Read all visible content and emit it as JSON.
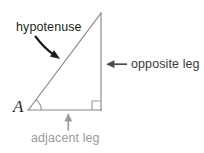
{
  "figure": {
    "kind": "right-triangle-geometry-diagram",
    "width": 204,
    "height": 153,
    "background_color": "#ffffff",
    "labels": {
      "hypotenuse": "hypotenuse",
      "opposite_leg": "opposite leg",
      "adjacent_leg": "adjacent leg",
      "vertex_a": "A"
    },
    "colors": {
      "triangle_stroke": "#8a8a8a",
      "hypotenuse_stroke": "#8a8a8a",
      "right_angle_marker": "#9a9a9a",
      "angle_arc": "#8a8a8a",
      "hypotenuse_text": "#231f20",
      "hypotenuse_arrow": "#1a1a1a",
      "opposite_text": "#3a3a3a",
      "opposite_arrow": "#4a4a4a",
      "adjacent_text": "#9a9a9a",
      "adjacent_arrow": "#9a9a9a",
      "vertex_text": "#2b2b2b"
    },
    "geometry": {
      "vertex_a": [
        28,
        110
      ],
      "vertex_right_angle": [
        101,
        110
      ],
      "vertex_apex": [
        101,
        13
      ],
      "angle_arc_radius": 13,
      "right_angle_marker_size": 9
    },
    "annotations": [
      {
        "name": "hypotenuse-callout",
        "text": "hypotenuse",
        "arrow": "curved-down-right",
        "target": "hypotenuse side"
      },
      {
        "name": "opposite-leg-callout",
        "text": "opposite leg",
        "arrow": "straight-left",
        "target": "vertical side"
      },
      {
        "name": "adjacent-leg-callout",
        "text": "adjacent leg",
        "arrow": "straight-up",
        "target": "horizontal side"
      }
    ]
  }
}
